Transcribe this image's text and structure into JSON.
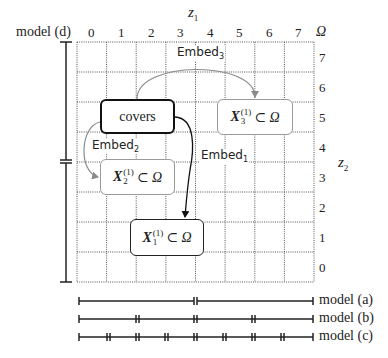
{
  "axes": {
    "x_title": "z",
    "x_title_sub": "1",
    "y_title": "z",
    "y_title_sub": "2",
    "corner_label": "Ω",
    "x_ticks": [
      "0",
      "1",
      "2",
      "3",
      "4",
      "5",
      "6",
      "7"
    ],
    "y_ticks": [
      "7",
      "6",
      "5",
      "4",
      "3",
      "2",
      "1",
      "0"
    ]
  },
  "left_model": {
    "label": "model (d)"
  },
  "nodes": {
    "covers": {
      "label": "covers"
    },
    "x3": {
      "symbol": "X",
      "sup": "(1)",
      "sub": "3",
      "rest": "⊂ Ω"
    },
    "x2": {
      "symbol": "X",
      "sup": "(1)",
      "sub": "2",
      "rest": "⊂ Ω"
    },
    "x1": {
      "symbol": "X",
      "sup": "(1)",
      "sub": "1",
      "rest": "⊂ Ω"
    }
  },
  "edges": {
    "embed1": {
      "label": "Embed",
      "sub": "1"
    },
    "embed2": {
      "label": "Embed",
      "sub": "2"
    },
    "embed3": {
      "label": "Embed",
      "sub": "3"
    }
  },
  "models": [
    {
      "label": "model (a)",
      "segments": 2
    },
    {
      "label": "model (b)",
      "segments": 4
    },
    {
      "label": "model (c)",
      "segments": 8
    }
  ],
  "colors": {
    "grid": "#555555",
    "dark": "#111111",
    "gray_arrow": "#8a8a8a"
  }
}
